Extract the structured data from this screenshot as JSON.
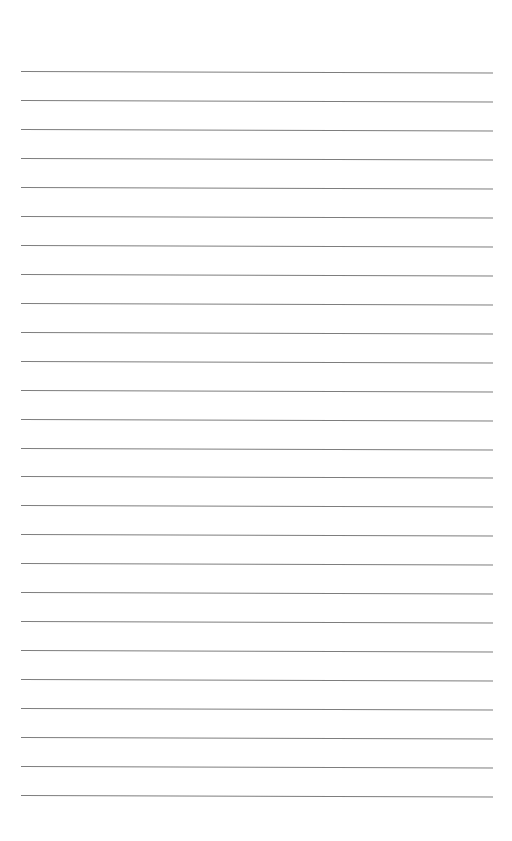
{
  "page": {
    "type": "blank-ruled-sheet",
    "background_color": "#ffffff",
    "rule_color": "#7d7d7d",
    "rule_count": 26,
    "first_rule_y": 71,
    "rule_spacing": 28.96,
    "rule_left_x": 21,
    "rule_right_x": 493,
    "rule_tilt_px": 1.5,
    "text_lines": [
      "",
      "",
      "",
      "",
      "",
      "",
      "",
      "",
      "",
      "",
      "",
      "",
      "",
      "",
      "",
      "",
      "",
      "",
      "",
      "",
      "",
      "",
      "",
      "",
      "",
      ""
    ]
  }
}
